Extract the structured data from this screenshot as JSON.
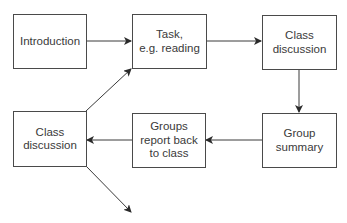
{
  "diagram": {
    "type": "flowchart",
    "nodes": [
      {
        "id": "intro",
        "label": "Introduction"
      },
      {
        "id": "task",
        "label": "Task,\ne.g. reading"
      },
      {
        "id": "class1",
        "label": "Class\ndiscussion"
      },
      {
        "id": "summary",
        "label": "Group\nsummary"
      },
      {
        "id": "report",
        "label": "Groups\nreport back\nto class"
      },
      {
        "id": "class2",
        "label": "Class\ndiscussion"
      }
    ],
    "edges": [
      {
        "from": "intro",
        "to": "task"
      },
      {
        "from": "task",
        "to": "class1"
      },
      {
        "from": "class1",
        "to": "summary"
      },
      {
        "from": "summary",
        "to": "report"
      },
      {
        "from": "report",
        "to": "class2"
      },
      {
        "from": "class2",
        "to": "task"
      },
      {
        "from": "class2",
        "to": "(continues)"
      }
    ],
    "colors": {
      "line": "#3a3a3a",
      "border": "#4a4a4a",
      "text": "#3a3a3a"
    }
  }
}
